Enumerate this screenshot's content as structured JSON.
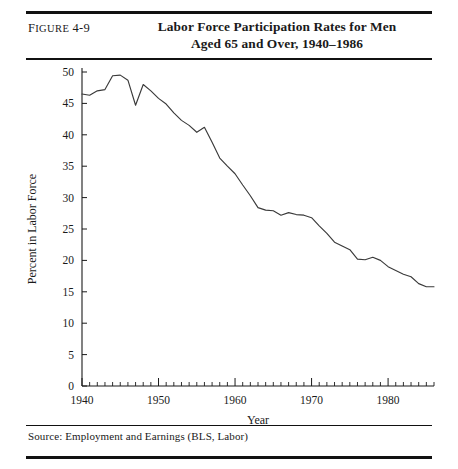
{
  "figure": {
    "number_prefix": "F",
    "number_smallcaps": "IGURE",
    "number": " 4-9",
    "number_full": "Figure 4-9",
    "title_line1": "Labor Force Participation Rates for Men",
    "title_line2": "Aged 65 and Over, 1940–1986",
    "source": "Source: Employment and Earnings (BLS, Labor)"
  },
  "chart_data": {
    "type": "line",
    "title": "Labor Force Participation Rates for Men Aged 65 and Over, 1940–1986",
    "xlabel": "Year",
    "ylabel": "Percent in Labor Force",
    "xlim": [
      1940,
      1986
    ],
    "ylim": [
      0,
      50
    ],
    "ytick_step": 5,
    "yticks": [
      0,
      5,
      10,
      15,
      20,
      25,
      30,
      35,
      40,
      45,
      50
    ],
    "ytick_labels": [
      "0",
      "5",
      "10",
      "15",
      "20",
      "25",
      "30",
      "35",
      "40",
      "45",
      "50"
    ],
    "xticks_major": [
      1940,
      1950,
      1960,
      1970,
      1980
    ],
    "xtick_labels": [
      "1940",
      "1950",
      "1960",
      "1970",
      "1980"
    ],
    "xtick_minor_step": 1,
    "grid": false,
    "legend": false,
    "line_color": "#3a3a3a",
    "series": [
      {
        "name": "Men aged 65 and over",
        "x": [
          1940,
          1941,
          1942,
          1943,
          1944,
          1945,
          1946,
          1947,
          1948,
          1949,
          1950,
          1951,
          1952,
          1953,
          1954,
          1955,
          1956,
          1957,
          1958,
          1959,
          1960,
          1961,
          1962,
          1963,
          1964,
          1965,
          1966,
          1967,
          1968,
          1969,
          1970,
          1971,
          1972,
          1973,
          1974,
          1975,
          1976,
          1977,
          1978,
          1979,
          1980,
          1981,
          1982,
          1983,
          1984,
          1985,
          1986
        ],
        "values": [
          46.5,
          46.3,
          47.0,
          47.2,
          49.4,
          49.5,
          48.7,
          44.7,
          48.0,
          47.0,
          45.8,
          44.9,
          43.5,
          42.3,
          41.5,
          40.4,
          41.2,
          38.8,
          36.3,
          35.0,
          33.8,
          32.0,
          30.3,
          28.4,
          28.0,
          27.9,
          27.2,
          27.6,
          27.3,
          27.2,
          26.8,
          25.5,
          24.3,
          22.9,
          22.3,
          21.7,
          20.2,
          20.1,
          20.5,
          20.0,
          19.0,
          18.4,
          17.8,
          17.4,
          16.3,
          15.8,
          15.8
        ]
      }
    ]
  }
}
